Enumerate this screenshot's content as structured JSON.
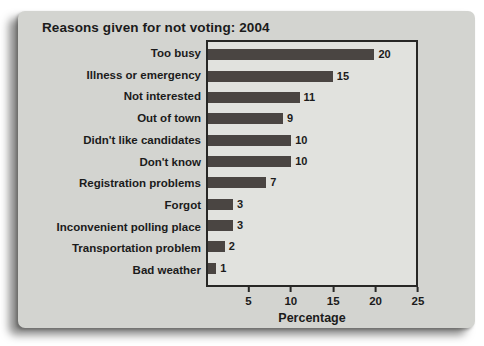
{
  "chart_data": {
    "type": "bar",
    "orientation": "horizontal",
    "title": "Reasons given for not voting: 2004",
    "categories": [
      "Too busy",
      "Illness or emergency",
      "Not interested",
      "Out of town",
      "Didn't like candidates",
      "Don't know",
      "Registration problems",
      "Forgot",
      "Inconvenient polling place",
      "Transportation problem",
      "Bad weather"
    ],
    "values": [
      20,
      15,
      11,
      9,
      10,
      10,
      7,
      3,
      3,
      2,
      1
    ],
    "value_labels": [
      "20",
      "15",
      "11",
      "9",
      "10",
      "10",
      "7",
      "3",
      "3",
      "2",
      "1"
    ],
    "xlabel": "Percentage",
    "x_ticks": [
      5,
      10,
      15,
      20,
      25
    ],
    "xlim": [
      0,
      25
    ],
    "grid": false,
    "legend": false,
    "colors": {
      "bar": "#4a4542",
      "plot_bg": "#e1e2de",
      "card_bg": "#d3d4d0",
      "axis": "#272725",
      "text": "#1b1b1b",
      "page_bg": "#ffffff"
    }
  }
}
